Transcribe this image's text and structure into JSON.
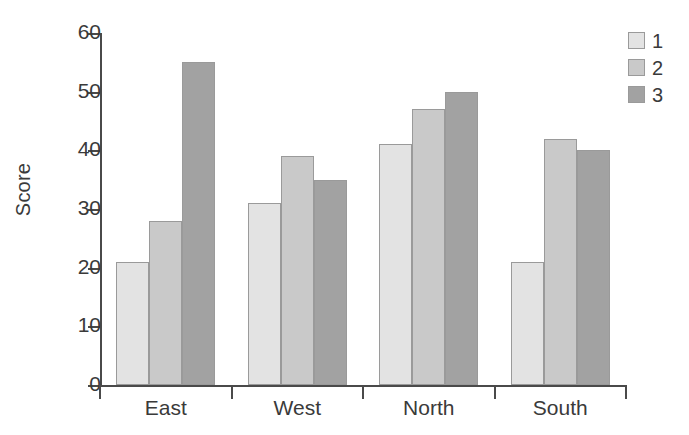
{
  "chart_data": {
    "type": "bar",
    "title": "",
    "xlabel": "",
    "ylabel": "Score",
    "categories": [
      "East",
      "West",
      "North",
      "South"
    ],
    "series": [
      {
        "name": "1",
        "color": "#e3e3e3",
        "values": [
          21,
          31,
          41,
          21
        ]
      },
      {
        "name": "2",
        "color": "#c9c9c9",
        "values": [
          28,
          39,
          47,
          42
        ]
      },
      {
        "name": "3",
        "color": "#a2a2a2",
        "values": [
          55,
          35,
          50,
          40
        ]
      }
    ],
    "ylim": [
      0,
      60
    ],
    "ytick_labels": [
      "0",
      "10",
      "20",
      "30",
      "40",
      "50",
      "60"
    ],
    "ytick_values": [
      0,
      10,
      20,
      30,
      40,
      50,
      60
    ],
    "grid": false,
    "legend_position": "top-right",
    "axis_color": "#4a4a4a",
    "bar_border_color": "#9a9a9a",
    "text_color": "#3a3a3a",
    "background": "#ffffff"
  },
  "legend": {
    "items": [
      {
        "label": "1",
        "color": "#e3e3e3"
      },
      {
        "label": "2",
        "color": "#c9c9c9"
      },
      {
        "label": "3",
        "color": "#a2a2a2"
      }
    ]
  }
}
